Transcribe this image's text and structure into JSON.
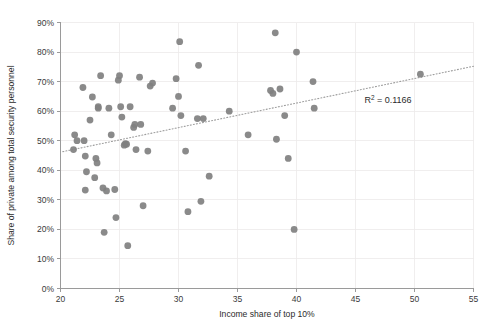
{
  "chart_data": {
    "type": "scatter",
    "title": "",
    "xlabel": "Income share of top 10%",
    "ylabel": "Share of private among total security personnel",
    "xlim": [
      20,
      55
    ],
    "ylim": [
      0,
      90
    ],
    "xticks": [
      20,
      25,
      30,
      35,
      40,
      45,
      50,
      55
    ],
    "xtick_labels": [
      "20",
      "25",
      "30",
      "35",
      "40",
      "45",
      "50",
      "55"
    ],
    "yticks": [
      0,
      10,
      20,
      30,
      40,
      50,
      60,
      70,
      80,
      90
    ],
    "ytick_labels": [
      "0%",
      "10%",
      "20%",
      "30%",
      "40%",
      "50%",
      "60%",
      "70%",
      "80%",
      "90%"
    ],
    "grid": true,
    "legend": false,
    "marker_color": "#808080",
    "trendline_color": "#9e9e9e",
    "annotation": "R² = 0.1166",
    "annotation_base": "R",
    "annotation_sup": "2",
    "annotation_rest": " = 0.1166",
    "r_squared": 0.1166,
    "trendline": {
      "x_start": 20.2,
      "y_start": 46.3,
      "x_end": 55.0,
      "y_end": 75.2
    },
    "points": [
      {
        "x": 21.2,
        "y": 52.0
      },
      {
        "x": 21.1,
        "y": 47.0
      },
      {
        "x": 21.4,
        "y": 50.0
      },
      {
        "x": 21.9,
        "y": 68.0
      },
      {
        "x": 22.0,
        "y": 50.0
      },
      {
        "x": 22.1,
        "y": 44.8
      },
      {
        "x": 22.2,
        "y": 39.5
      },
      {
        "x": 22.1,
        "y": 33.3
      },
      {
        "x": 22.5,
        "y": 57.0
      },
      {
        "x": 22.7,
        "y": 64.8
      },
      {
        "x": 22.9,
        "y": 37.5
      },
      {
        "x": 23.0,
        "y": 44.0
      },
      {
        "x": 23.1,
        "y": 42.5
      },
      {
        "x": 23.2,
        "y": 61.5
      },
      {
        "x": 23.4,
        "y": 72.0
      },
      {
        "x": 23.2,
        "y": 61.0
      },
      {
        "x": 23.6,
        "y": 34.0
      },
      {
        "x": 23.7,
        "y": 19.0
      },
      {
        "x": 23.9,
        "y": 33.0
      },
      {
        "x": 24.1,
        "y": 61.0
      },
      {
        "x": 24.3,
        "y": 52.0
      },
      {
        "x": 24.6,
        "y": 33.5
      },
      {
        "x": 24.7,
        "y": 24.0
      },
      {
        "x": 24.9,
        "y": 70.5
      },
      {
        "x": 25.0,
        "y": 72.0
      },
      {
        "x": 25.1,
        "y": 61.5
      },
      {
        "x": 25.2,
        "y": 58.0
      },
      {
        "x": 25.4,
        "y": 48.5
      },
      {
        "x": 25.5,
        "y": 49.0
      },
      {
        "x": 25.6,
        "y": 48.8
      },
      {
        "x": 25.7,
        "y": 14.5
      },
      {
        "x": 25.9,
        "y": 61.5
      },
      {
        "x": 26.2,
        "y": 54.5
      },
      {
        "x": 26.3,
        "y": 55.5
      },
      {
        "x": 26.4,
        "y": 47.0
      },
      {
        "x": 26.7,
        "y": 71.5
      },
      {
        "x": 26.8,
        "y": 55.5
      },
      {
        "x": 27.0,
        "y": 28.0
      },
      {
        "x": 27.4,
        "y": 46.5
      },
      {
        "x": 27.6,
        "y": 68.5
      },
      {
        "x": 27.8,
        "y": 69.5
      },
      {
        "x": 29.5,
        "y": 61.0
      },
      {
        "x": 29.8,
        "y": 71.0
      },
      {
        "x": 30.1,
        "y": 83.5
      },
      {
        "x": 30.0,
        "y": 65.0
      },
      {
        "x": 30.2,
        "y": 58.5
      },
      {
        "x": 30.6,
        "y": 46.5
      },
      {
        "x": 30.8,
        "y": 26.0
      },
      {
        "x": 31.7,
        "y": 75.5
      },
      {
        "x": 31.6,
        "y": 57.5
      },
      {
        "x": 31.9,
        "y": 29.5
      },
      {
        "x": 32.1,
        "y": 57.5
      },
      {
        "x": 32.6,
        "y": 38.0
      },
      {
        "x": 34.3,
        "y": 60.0
      },
      {
        "x": 35.9,
        "y": 52.0
      },
      {
        "x": 37.8,
        "y": 67.0
      },
      {
        "x": 38.0,
        "y": 66.0
      },
      {
        "x": 38.2,
        "y": 86.5
      },
      {
        "x": 38.3,
        "y": 50.5
      },
      {
        "x": 38.6,
        "y": 67.5
      },
      {
        "x": 39.0,
        "y": 58.5
      },
      {
        "x": 39.3,
        "y": 44.0
      },
      {
        "x": 39.8,
        "y": 20.0
      },
      {
        "x": 40.0,
        "y": 80.0
      },
      {
        "x": 41.4,
        "y": 70.0
      },
      {
        "x": 41.5,
        "y": 61.0
      },
      {
        "x": 50.5,
        "y": 72.5
      }
    ]
  }
}
